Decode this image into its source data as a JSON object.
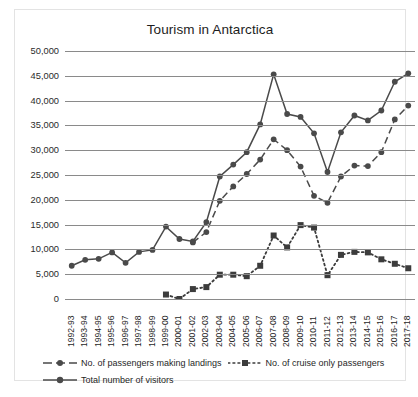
{
  "chart_data": {
    "type": "line",
    "title": "Tourism in Antarctica",
    "xlabel": "",
    "ylabel": "",
    "ylim": [
      0,
      50000
    ],
    "ytick_step": 5000,
    "ytick_labels": [
      "50,000",
      "45,000",
      "40,000",
      "35,000",
      "30,000",
      "25,000",
      "20,000",
      "15,000",
      "10,000",
      "5,000",
      "0"
    ],
    "grid": true,
    "legend_position": "bottom",
    "categories": [
      "1992-93",
      "1993-94",
      "1994-95",
      "1995-96",
      "1996-97",
      "1997-98",
      "1998-99",
      "1999-00",
      "2000-01",
      "2001-02",
      "2002-03",
      "2003-04",
      "2004-05",
      "2005-06",
      "2006-07",
      "2007-08",
      "2008-09",
      "2009-10",
      "2010-11",
      "2011-12",
      "2012-13",
      "2013-14",
      "2014-15",
      "2015-16",
      "2016-17",
      "2017-18"
    ],
    "series": [
      {
        "name": "No. of passengers making landings",
        "style": "dashed",
        "marker": "circle",
        "color": "#4a4a4a",
        "values": [
          null,
          null,
          null,
          null,
          null,
          null,
          null,
          null,
          null,
          11400,
          13500,
          19800,
          22700,
          25200,
          28100,
          32200,
          30000,
          26700,
          20800,
          19400,
          24700,
          26900,
          26800,
          29600,
          36200,
          39000
        ]
      },
      {
        "name": "No. of cruise only passengers",
        "style": "dotted",
        "marker": "square",
        "color": "#3c3c3c",
        "values": [
          null,
          null,
          null,
          null,
          null,
          null,
          null,
          900,
          0,
          2000,
          2400,
          4900,
          4900,
          4600,
          6700,
          12800,
          10400,
          14900,
          14400,
          4800,
          8900,
          9500,
          9400,
          8000,
          7100,
          6200
        ]
      },
      {
        "name": "Total number of visitors",
        "style": "solid",
        "marker": "circle",
        "color": "#4a4a4a",
        "values": [
          6700,
          7900,
          8100,
          9400,
          7300,
          9500,
          9900,
          14600,
          12100,
          11600,
          15500,
          24700,
          27100,
          29600,
          35200,
          45300,
          37300,
          36700,
          33400,
          25600,
          33600,
          37000,
          36000,
          38000,
          43800,
          45500
        ]
      }
    ]
  },
  "legend": {
    "items": [
      {
        "label": "No. of passengers making landings"
      },
      {
        "label": "No. of cruise only passengers"
      },
      {
        "label": "Total number of visitors"
      }
    ]
  }
}
